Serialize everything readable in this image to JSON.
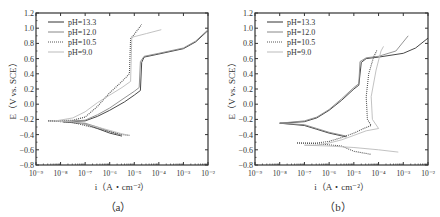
{
  "chart_data": [
    {
      "type": "line",
      "panel_label": "（a）",
      "xlabel": "i（A・cm⁻²）",
      "ylabel": "E（V vs. SCE）",
      "xscale": "log",
      "xlim": [
        1e-09,
        0.01
      ],
      "ylim": [
        -0.8,
        1.2
      ],
      "xticks": [
        "10⁻⁹",
        "10⁻⁸",
        "10⁻⁷",
        "10⁻⁶",
        "10⁻⁵",
        "10⁻⁴",
        "10⁻³",
        "10⁻²"
      ],
      "yticks": [
        "1.2",
        "1.0",
        "0.8",
        "0.6",
        "0.4",
        "0.2",
        "0.0",
        "−0.2",
        "−0.4",
        "−0.6",
        "−0.8"
      ],
      "legend_position": "upper left",
      "grid": false,
      "series": [
        {
          "name": "pH=13.3",
          "style": "solid",
          "color": "#333333",
          "anodic": [
            [
              -7.9,
              -0.23
            ],
            [
              -7.0,
              -0.22
            ],
            [
              -6.5,
              -0.16
            ],
            [
              -6.0,
              -0.08
            ],
            [
              -5.4,
              0.03
            ],
            [
              -5.0,
              0.12
            ],
            [
              -4.75,
              0.18
            ],
            [
              -4.7,
              0.55
            ],
            [
              -4.6,
              0.62
            ],
            [
              -4.0,
              0.66
            ],
            [
              -3.0,
              0.73
            ],
            [
              -2.5,
              0.82
            ],
            [
              -2.0,
              0.97
            ]
          ],
          "cathodic": [
            [
              -7.9,
              -0.23
            ],
            [
              -7.0,
              -0.26
            ],
            [
              -6.5,
              -0.32
            ],
            [
              -6.0,
              -0.38
            ],
            [
              -5.5,
              -0.42
            ]
          ]
        },
        {
          "name": "pH=12.0",
          "style": "solid",
          "color": "#888888",
          "anodic": [
            [
              -7.9,
              -0.23
            ],
            [
              -7.0,
              -0.21
            ],
            [
              -6.5,
              -0.14
            ],
            [
              -6.0,
              -0.05
            ],
            [
              -5.5,
              0.06
            ],
            [
              -5.0,
              0.17
            ],
            [
              -4.8,
              0.22
            ],
            [
              -4.75,
              0.56
            ],
            [
              -4.6,
              0.63
            ],
            [
              -4.0,
              0.67
            ],
            [
              -3.0,
              0.74
            ],
            [
              -2.5,
              0.83
            ],
            [
              -2.0,
              0.98
            ]
          ],
          "cathodic": [
            [
              -7.9,
              -0.23
            ],
            [
              -7.0,
              -0.25
            ],
            [
              -6.5,
              -0.3
            ],
            [
              -6.0,
              -0.36
            ],
            [
              -5.5,
              -0.41
            ]
          ]
        },
        {
          "name": "pH=10.5",
          "style": "dotted",
          "color": "#555555",
          "anodic": [
            [
              -8.5,
              -0.22
            ],
            [
              -7.5,
              -0.21
            ],
            [
              -7.0,
              -0.17
            ],
            [
              -6.5,
              -0.03
            ],
            [
              -6.0,
              0.15
            ],
            [
              -5.5,
              0.3
            ],
            [
              -5.2,
              0.4
            ],
            [
              -5.15,
              0.86
            ],
            [
              -5.0,
              0.92
            ],
            [
              -4.7,
              1.05
            ]
          ],
          "cathodic": [
            [
              -8.5,
              -0.22
            ],
            [
              -7.5,
              -0.24
            ],
            [
              -6.5,
              -0.32
            ],
            [
              -5.5,
              -0.4
            ],
            [
              -5.2,
              -0.41
            ]
          ]
        },
        {
          "name": "pH=9.0",
          "style": "solid",
          "color": "#bbbbbb",
          "anodic": [
            [
              -8.2,
              -0.22
            ],
            [
              -7.5,
              -0.18
            ],
            [
              -7.0,
              -0.1
            ],
            [
              -6.5,
              0.02
            ],
            [
              -6.0,
              0.12
            ],
            [
              -5.5,
              0.22
            ],
            [
              -5.15,
              0.3
            ],
            [
              -5.1,
              0.88
            ],
            [
              -4.5,
              0.93
            ],
            [
              -3.9,
              0.98
            ]
          ],
          "cathodic": [
            [
              -8.2,
              -0.22
            ],
            [
              -7.5,
              -0.23
            ],
            [
              -6.5,
              -0.3
            ],
            [
              -5.5,
              -0.39
            ],
            [
              -5.2,
              -0.41
            ]
          ]
        }
      ]
    },
    {
      "type": "line",
      "panel_label": "（b）",
      "xlabel": "i（A・cm⁻²）",
      "ylabel": "E（V vs. SCE）",
      "xscale": "log",
      "xlim": [
        1e-09,
        0.01
      ],
      "ylim": [
        -0.8,
        1.2
      ],
      "xticks": [
        "10⁻⁹",
        "10⁻⁸",
        "10⁻⁷",
        "10⁻⁶",
        "10⁻⁵",
        "10⁻⁴",
        "10⁻³",
        "10⁻²"
      ],
      "yticks": [
        "1.2",
        "1.0",
        "0.8",
        "0.6",
        "0.4",
        "0.2",
        "0.0",
        "−0.2",
        "−0.4",
        "−0.6",
        "−0.8"
      ],
      "legend_position": "upper left",
      "grid": false,
      "series": [
        {
          "name": "pH=13.3",
          "style": "solid",
          "color": "#333333",
          "anodic": [
            [
              -8.0,
              -0.25
            ],
            [
              -7.0,
              -0.23
            ],
            [
              -6.5,
              -0.18
            ],
            [
              -6.0,
              -0.08
            ],
            [
              -5.5,
              0.05
            ],
            [
              -5.0,
              0.2
            ],
            [
              -4.8,
              0.25
            ],
            [
              -4.7,
              0.55
            ],
            [
              -4.5,
              0.6
            ],
            [
              -4.0,
              0.62
            ],
            [
              -3.0,
              0.67
            ],
            [
              -2.5,
              0.74
            ],
            [
              -2.0,
              0.87
            ]
          ],
          "cathodic": [
            [
              -8.0,
              -0.25
            ],
            [
              -7.0,
              -0.28
            ],
            [
              -6.5,
              -0.33
            ],
            [
              -6.0,
              -0.38
            ],
            [
              -5.3,
              -0.43
            ]
          ]
        },
        {
          "name": "pH=12.0",
          "style": "solid",
          "color": "#888888",
          "anodic": [
            [
              -8.0,
              -0.25
            ],
            [
              -7.0,
              -0.22
            ],
            [
              -6.5,
              -0.17
            ],
            [
              -6.0,
              -0.07
            ],
            [
              -5.5,
              0.07
            ],
            [
              -5.0,
              0.22
            ],
            [
              -4.8,
              0.27
            ],
            [
              -4.75,
              0.56
            ],
            [
              -4.5,
              0.61
            ],
            [
              -4.0,
              0.63
            ],
            [
              -3.3,
              0.7
            ],
            [
              -2.8,
              0.9
            ]
          ],
          "cathodic": [
            [
              -8.0,
              -0.25
            ],
            [
              -7.0,
              -0.27
            ],
            [
              -6.5,
              -0.32
            ],
            [
              -6.0,
              -0.37
            ],
            [
              -5.3,
              -0.42
            ]
          ]
        },
        {
          "name": "pH=10.5",
          "style": "dotted",
          "color": "#555555",
          "anodic": [
            [
              -7.3,
              -0.51
            ],
            [
              -6.5,
              -0.51
            ],
            [
              -6.0,
              -0.49
            ],
            [
              -5.5,
              -0.44
            ],
            [
              -5.0,
              -0.38
            ],
            [
              -4.6,
              -0.32
            ],
            [
              -4.3,
              -0.28
            ],
            [
              -4.45,
              -0.2
            ],
            [
              -4.5,
              0.1
            ],
            [
              -4.4,
              0.4
            ],
            [
              -4.2,
              0.62
            ],
            [
              -4.05,
              0.72
            ]
          ],
          "cathodic": [
            [
              -7.3,
              -0.51
            ],
            [
              -6.5,
              -0.52
            ],
            [
              -5.5,
              -0.55
            ],
            [
              -5.0,
              -0.62
            ],
            [
              -4.3,
              -0.66
            ]
          ]
        },
        {
          "name": "pH=9.0",
          "style": "solid",
          "color": "#bbbbbb",
          "anodic": [
            [
              -7.0,
              -0.54
            ],
            [
              -6.5,
              -0.54
            ],
            [
              -6.0,
              -0.51
            ],
            [
              -5.5,
              -0.47
            ],
            [
              -5.0,
              -0.41
            ],
            [
              -4.5,
              -0.35
            ],
            [
              -4.0,
              -0.32
            ],
            [
              -4.25,
              -0.2
            ],
            [
              -4.3,
              0.1
            ],
            [
              -4.1,
              0.45
            ],
            [
              -3.9,
              0.7
            ],
            [
              -3.8,
              0.76
            ]
          ],
          "cathodic": [
            [
              -7.0,
              -0.54
            ],
            [
              -6.0,
              -0.55
            ],
            [
              -5.0,
              -0.57
            ],
            [
              -4.0,
              -0.6
            ],
            [
              -3.2,
              -0.63
            ]
          ]
        }
      ]
    }
  ],
  "panels": {
    "a": {
      "caption": "（a）",
      "xlabel": "i（A・cm⁻²）",
      "ylabel": "E（V vs. SCE）"
    },
    "b": {
      "caption": "（b）",
      "xlabel": "i（A・cm⁻²）",
      "ylabel": "E（V vs. SCE）"
    }
  },
  "legend": [
    "pH=13.3",
    "pH=12.0",
    "pH=10.5",
    "pH=9.0"
  ]
}
